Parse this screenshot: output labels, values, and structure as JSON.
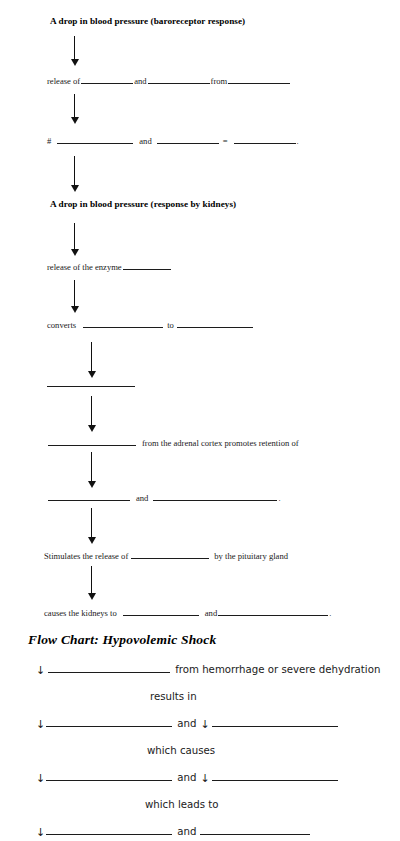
{
  "document": {
    "title": "Blood Pressure Regulation and Hypovolemic Shock Flow Chart Worksheet"
  },
  "section_one": {
    "heading": "A drop in blood pressure (baroreceptor response)",
    "steps": [
      {
        "id": "release-of",
        "parts": [
          "release of",
          "and",
          "from"
        ],
        "trailing": ""
      },
      {
        "id": "hash-equation",
        "parts": [
          "#",
          "and",
          "="
        ],
        "trailing": "."
      }
    ]
  },
  "section_two": {
    "heading": "A drop in blood pressure (response by kidneys)",
    "steps": [
      {
        "id": "enzyme",
        "parts": [
          "release of the enzyme"
        ],
        "trailing": ""
      },
      {
        "id": "converts",
        "parts": [
          "converts",
          "to"
        ],
        "trailing": ""
      },
      {
        "id": "lone-blank",
        "parts": [],
        "trailing": ""
      },
      {
        "id": "adrenal",
        "parts": [
          "",
          "from the adrenal cortex promotes retention of"
        ],
        "trailing": ""
      },
      {
        "id": "and-blank",
        "parts": [
          "",
          "and"
        ],
        "trailing": "."
      },
      {
        "id": "pituitary",
        "parts": [
          "Stimulates the release of",
          "by the pituitary gland"
        ],
        "trailing": ""
      },
      {
        "id": "kidneys",
        "parts": [
          "causes the kidneys to",
          "and"
        ],
        "trailing": "."
      }
    ]
  },
  "flow_chart": {
    "title": "Flow Chart: Hypovolemic Shock",
    "arrow_glyph": "↓",
    "rows": [
      {
        "id": "row-1",
        "lead_arrow": true,
        "text_after": "from hemorrhage or severe dehydration",
        "connector": "",
        "second_arrow": false
      },
      {
        "id": "connector-1",
        "connector_text": "results in"
      },
      {
        "id": "row-2",
        "lead_arrow": true,
        "connector": "and",
        "second_arrow": true
      },
      {
        "id": "connector-2",
        "connector_text": "which causes"
      },
      {
        "id": "row-3",
        "lead_arrow": true,
        "connector": "and",
        "second_arrow": true
      },
      {
        "id": "connector-3",
        "connector_text": "which leads to"
      },
      {
        "id": "row-4",
        "lead_arrow": true,
        "connector": "and",
        "second_arrow": false
      }
    ]
  },
  "colors": {
    "ink": "#111111",
    "paper": "#ffffff",
    "rule": "#1c1c1c"
  }
}
